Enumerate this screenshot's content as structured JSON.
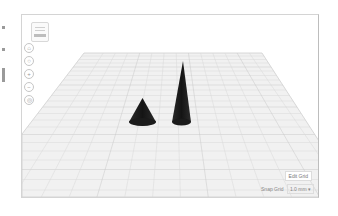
{
  "app": {
    "title": "3D workplane editor"
  },
  "left_strip": {
    "marks": [
      {
        "top": 26,
        "height": 3
      },
      {
        "top": 48,
        "height": 3
      },
      {
        "top": 68,
        "height": 14
      }
    ]
  },
  "viewport": {
    "view_cube": {
      "name": "view-cube"
    },
    "nav_buttons": [
      {
        "name": "home-view",
        "glyph": "⌂"
      },
      {
        "name": "fit-view",
        "glyph": "○"
      },
      {
        "name": "zoom-in",
        "glyph": "+"
      },
      {
        "name": "zoom-out",
        "glyph": "−"
      },
      {
        "name": "orthographic",
        "glyph": "◎"
      }
    ],
    "workplane": {
      "grid_color": "#d6d6d6",
      "plane_color": "#f2f2f2",
      "major_grid_color": "#c4c4c4"
    },
    "objects": [
      {
        "type": "cone",
        "label": "short-cone",
        "color": "#1e1e1e"
      },
      {
        "type": "cone",
        "label": "tall-cone",
        "color": "#1e1e1e"
      }
    ],
    "edit_grid_label": "Edit Grid",
    "snap_grid_label": "Snap Grid",
    "snap_grid_value": "1.0 mm",
    "snap_grid_caret": "▾"
  }
}
